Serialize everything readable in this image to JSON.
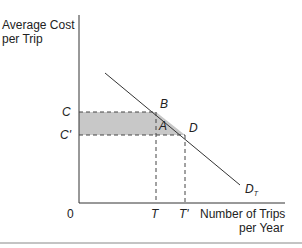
{
  "figure": {
    "y_axis_label_line1": "Average Cost",
    "y_axis_label_line2": "per Trip",
    "x_axis_label_line1": "Number of Trips",
    "x_axis_label_line2": "per Year",
    "origin_label": "0",
    "y_ticks": [
      "C",
      "C'"
    ],
    "x_ticks": [
      "T",
      "T'"
    ],
    "points": [
      "B",
      "A",
      "D"
    ],
    "curve_label": "D",
    "curve_subscript": "T",
    "shaded_color": "#c8c8c8",
    "line_color": "#333333"
  }
}
